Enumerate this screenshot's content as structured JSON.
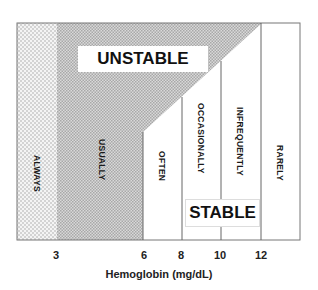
{
  "diagram": {
    "type": "hemoglobin transfusion-need region diagram",
    "regions": {
      "unstable_label": "UNSTABLE",
      "stable_label": "STABLE"
    },
    "columns": [
      {
        "label": "ALWAYS",
        "from": 0,
        "to": 3
      },
      {
        "label": "USUALLY",
        "from": 3,
        "to": 6
      },
      {
        "label": "OFTEN",
        "from": 6,
        "to": 8
      },
      {
        "label": "OCCASIONALLY",
        "from": 8,
        "to": 10
      },
      {
        "label": "INFREQUENTLY",
        "from": 10,
        "to": 12
      },
      {
        "label": "RARELY",
        "from": 12,
        "to": 14
      }
    ],
    "x_axis": {
      "title": "Hemoglobin (mg/dL)",
      "ticks": [
        "3",
        "6",
        "8",
        "10",
        "12"
      ]
    },
    "colors": {
      "frame": "#777777",
      "always_fill": "#e6e6e6",
      "unstable_fill": "#cfcfcf",
      "background": "#ffffff"
    }
  }
}
